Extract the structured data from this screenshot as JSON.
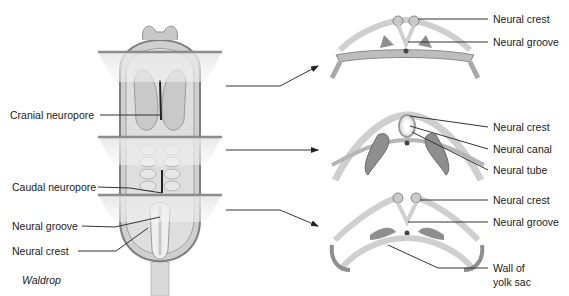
{
  "figure": {
    "credit": "Waldrop",
    "colors": {
      "tissue_light": "#d8d8d8",
      "tissue_mid": "#b4b4b4",
      "tissue_dark": "#8a8a8a",
      "plane": "#9a9a9a",
      "leader_line": "#333333",
      "notochord": "#444444"
    }
  },
  "left_labels": [
    {
      "id": "cranial-neuropore",
      "text": "Cranial neuropore"
    },
    {
      "id": "caudal-neuropore",
      "text": "Caudal neuropore"
    },
    {
      "id": "neural-groove",
      "text": "Neural groove"
    },
    {
      "id": "neural-crest",
      "text": "Neural crest"
    }
  ],
  "sections": [
    {
      "id": "section-top",
      "labels": [
        {
          "text": "Neural crest"
        },
        {
          "text": "Neural groove"
        }
      ]
    },
    {
      "id": "section-middle",
      "labels": [
        {
          "text": "Neural crest"
        },
        {
          "text": "Neural canal"
        },
        {
          "text": "Neural tube"
        }
      ]
    },
    {
      "id": "section-bottom",
      "labels": [
        {
          "text": "Neural crest"
        },
        {
          "text": "Neural groove"
        },
        {
          "text": "Wall of"
        },
        {
          "text": "yolk sac"
        }
      ]
    }
  ]
}
